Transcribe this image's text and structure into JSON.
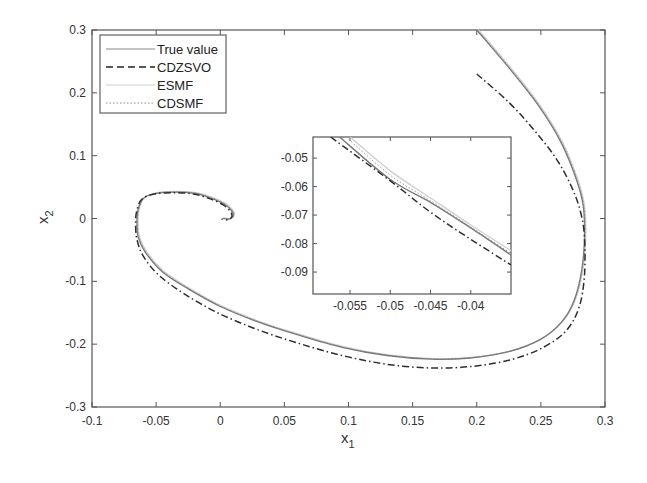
{
  "chart_data": {
    "type": "line",
    "title": "",
    "xlabel": "x_1",
    "ylabel": "x_2",
    "xlim": [
      -0.1,
      0.3
    ],
    "ylim": [
      -0.3,
      0.3
    ],
    "grid": false,
    "legend_position": "upper left",
    "xticks": [
      "-0.1",
      "-0.05",
      "0",
      "0.05",
      "0.1",
      "0.15",
      "0.2",
      "0.25",
      "0.3"
    ],
    "yticks": [
      "-0.3",
      "-0.2",
      "-0.1",
      "0",
      "0.1",
      "0.2",
      "0.3"
    ],
    "series": [
      {
        "name": "True value",
        "style": "solid",
        "color": "#888888",
        "x": [
          0.2,
          0.225,
          0.248,
          0.266,
          0.278,
          0.283,
          0.284,
          0.282,
          0.276,
          0.266,
          0.25,
          0.225,
          0.195,
          0.165,
          0.13,
          0.095,
          0.06,
          0.03,
          0.0,
          -0.025,
          -0.045,
          -0.058,
          -0.064,
          -0.065,
          -0.064,
          -0.06,
          -0.05,
          -0.035,
          -0.02,
          -0.008,
          0.003,
          0.009,
          0.01,
          0.007,
          0.002
        ],
        "y": [
          0.3,
          0.24,
          0.18,
          0.12,
          0.06,
          0.02,
          -0.027,
          -0.08,
          -0.13,
          -0.165,
          -0.192,
          -0.212,
          -0.222,
          -0.224,
          -0.218,
          -0.205,
          -0.185,
          -0.165,
          -0.14,
          -0.112,
          -0.085,
          -0.055,
          -0.03,
          -0.005,
          0.015,
          0.032,
          0.04,
          0.042,
          0.04,
          0.033,
          0.023,
          0.012,
          0.004,
          -0.001,
          0.0
        ]
      },
      {
        "name": "CDZSVO",
        "style": "dashdot",
        "color": "#333333",
        "x": [
          0.2,
          0.225,
          0.245,
          0.262,
          0.274,
          0.281,
          0.284,
          0.284,
          0.28,
          0.27,
          0.252,
          0.228,
          0.198,
          0.165,
          0.13,
          0.095,
          0.06,
          0.028,
          -0.002,
          -0.028,
          -0.048,
          -0.06,
          -0.065,
          -0.066,
          -0.065,
          -0.061,
          -0.051,
          -0.036,
          -0.021,
          -0.009,
          0.002,
          0.008,
          0.009,
          0.006,
          0.001
        ],
        "y": [
          0.23,
          0.185,
          0.14,
          0.095,
          0.05,
          0.01,
          -0.03,
          -0.09,
          -0.14,
          -0.178,
          -0.205,
          -0.224,
          -0.235,
          -0.238,
          -0.232,
          -0.218,
          -0.198,
          -0.176,
          -0.15,
          -0.12,
          -0.09,
          -0.06,
          -0.033,
          -0.007,
          0.013,
          0.031,
          0.039,
          0.041,
          0.039,
          0.032,
          0.022,
          0.011,
          0.003,
          -0.002,
          -0.001
        ]
      },
      {
        "name": "ESMF",
        "style": "solid-light",
        "color": "#c8c8c8",
        "note": "nearly overlaps True value"
      },
      {
        "name": "CDSMF",
        "style": "dotted",
        "color": "#999999",
        "note": "nearly overlaps True value"
      }
    ],
    "inset": {
      "xlim": [
        -0.0596,
        -0.035
      ],
      "ylim": [
        -0.0977,
        -0.0426
      ],
      "xticks": [
        "-0.055",
        "-0.05",
        "-0.045",
        "-0.04"
      ],
      "yticks": [
        "-0.05",
        "-0.06",
        "-0.07",
        "-0.08",
        "-0.09"
      ],
      "series": [
        {
          "name": "True value",
          "x": [
            -0.0563,
            -0.05,
            -0.045,
            -0.04,
            -0.035
          ],
          "y": [
            -0.0426,
            -0.0575,
            -0.0655,
            -0.0745,
            -0.084
          ]
        },
        {
          "name": "ESMF",
          "x": [
            -0.055,
            -0.05,
            -0.045,
            -0.04,
            -0.035
          ],
          "y": [
            -0.0426,
            -0.0545,
            -0.064,
            -0.0735,
            -0.0825
          ]
        },
        {
          "name": "CDSMF",
          "x": [
            -0.0555,
            -0.05,
            -0.045,
            -0.04,
            -0.035
          ],
          "y": [
            -0.0426,
            -0.056,
            -0.065,
            -0.0742,
            -0.0835
          ]
        },
        {
          "name": "CDZSVO",
          "x": [
            -0.0574,
            -0.05,
            -0.045,
            -0.04,
            -0.035
          ],
          "y": [
            -0.0426,
            -0.058,
            -0.069,
            -0.0785,
            -0.0875
          ]
        }
      ]
    }
  },
  "legend": {
    "items": [
      {
        "label": "True value",
        "style": "solid"
      },
      {
        "label": "CDZSVO",
        "style": "dashed"
      },
      {
        "label": "ESMF",
        "style": "solid-light"
      },
      {
        "label": "CDSMF",
        "style": "dotted"
      }
    ]
  },
  "axes": {
    "xlabel_main": "x",
    "xlabel_sub": "1",
    "ylabel_main": "x",
    "ylabel_sub": "2"
  }
}
